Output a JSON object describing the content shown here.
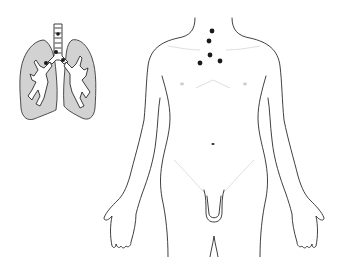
{
  "figure": {
    "type": "anatomical-diagram",
    "panels": [
      {
        "name": "lungs-inset",
        "description": "Lungs with trachea and bronchial tree; dark lymph node markers along trachea and hilum"
      },
      {
        "name": "body-outline",
        "description": "Front view male torso outline with dark node markers in the lower neck / supraclavicular region"
      }
    ],
    "colors": {
      "outline": "#2a2a2a",
      "lung_fill": "#d2d2d2",
      "node_marker": "#1a1a1a",
      "background": "#ffffff"
    },
    "body_node_markers": [
      {
        "x": 212,
        "y": 31
      },
      {
        "x": 209,
        "y": 41
      },
      {
        "x": 210,
        "y": 55
      },
      {
        "x": 200,
        "y": 63
      },
      {
        "x": 220,
        "y": 61
      }
    ],
    "lung_node_markers": [
      {
        "x": 58,
        "y": 34
      },
      {
        "x": 56,
        "y": 52
      },
      {
        "x": 63,
        "y": 60
      },
      {
        "x": 46,
        "y": 63
      }
    ]
  }
}
